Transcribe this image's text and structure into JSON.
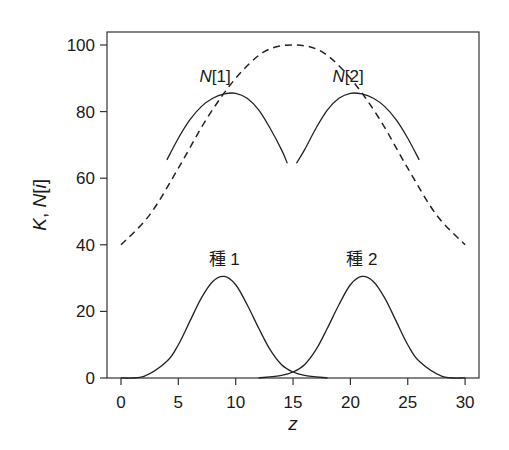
{
  "chart_data": {
    "type": "line",
    "title": "",
    "xlabel": "z",
    "ylabel": "K, N[i]",
    "xlim": [
      -1,
      31
    ],
    "ylim": [
      -2,
      107
    ],
    "grid": false,
    "legend": "none",
    "x_ticks": [
      "0",
      "5",
      "10",
      "15",
      "20",
      "25",
      "30"
    ],
    "y_ticks": [
      "0",
      "20",
      "40",
      "60",
      "80",
      "100"
    ],
    "annotations": [
      {
        "text": "N[1]",
        "x": 8.2,
        "y": 89
      },
      {
        "text": "N[2]",
        "x": 19.8,
        "y": 89
      },
      {
        "text": "種 1",
        "x": 9,
        "y": 34
      },
      {
        "text": "種 2",
        "x": 21,
        "y": 34
      }
    ],
    "series": [
      {
        "name": "K",
        "style": "dashed",
        "x": [
          0,
          2.5,
          5,
          7.5,
          10,
          12.5,
          15,
          17.5,
          20,
          22.5,
          25,
          27.5,
          30
        ],
        "values": [
          40,
          49,
          63,
          78,
          90,
          98,
          100,
          98,
          90,
          78,
          63,
          49,
          40
        ]
      },
      {
        "name": "N[1]",
        "style": "solid",
        "x": [
          4,
          5,
          6,
          7,
          8,
          9,
          10,
          11,
          12,
          13,
          14,
          14.5
        ],
        "values": [
          65.5,
          72,
          77.5,
          81.5,
          84,
          85.3,
          85.5,
          84,
          80.5,
          75,
          68.5,
          64.5
        ]
      },
      {
        "name": "N[2]",
        "style": "solid",
        "x": [
          15.3,
          16,
          17,
          18,
          19,
          20,
          21,
          22,
          23,
          24,
          25,
          26
        ],
        "values": [
          64.5,
          68.5,
          75,
          80.5,
          84,
          85.5,
          85.3,
          84,
          81.5,
          77.5,
          72,
          65.5
        ]
      },
      {
        "name": "種 1",
        "style": "solid",
        "x": [
          0,
          2,
          4,
          5,
          6,
          7,
          8,
          9,
          10,
          11,
          12,
          13,
          14,
          15,
          16,
          18
        ],
        "values": [
          0,
          0.5,
          5,
          10,
          17,
          24,
          29,
          30.5,
          28,
          22,
          15,
          8.5,
          4,
          1.8,
          0.8,
          0
        ]
      },
      {
        "name": "種 2",
        "style": "solid",
        "x": [
          12,
          14,
          15,
          16,
          17,
          18,
          19,
          20,
          21,
          22,
          23,
          24,
          25,
          26,
          28,
          30
        ],
        "values": [
          0,
          0.8,
          1.8,
          4,
          8.5,
          15,
          22,
          28,
          30.5,
          29,
          24,
          17,
          10,
          5,
          0.5,
          0
        ]
      }
    ]
  }
}
